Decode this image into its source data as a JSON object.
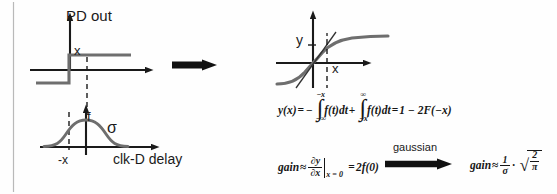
{
  "figure": {
    "width": 557,
    "height": 194,
    "background": "#fefefe",
    "curve_color": "#6e6e6e",
    "axis_color": "#1a1a1a",
    "border_color": "#b9b9b9"
  },
  "left_panel": {
    "step_plot": {
      "y_axis_label": "PD out",
      "x_marker_label": "x"
    },
    "gaussian_plot": {
      "amplitude_label": "f",
      "sigma_label": "σ",
      "neg_x_label": "-x",
      "x_axis_label": "clk-D delay"
    }
  },
  "transition_arrow": {
    "name": "right-arrow"
  },
  "right_panel": {
    "sigmoid_plot": {
      "y_axis_label": "y",
      "x_marker_label": "x"
    },
    "integral_equation": {
      "lhs": "y(x)",
      "equals": "=",
      "minus": "−",
      "integral_1": {
        "upper_limit": "−x",
        "lower_limit": "−∞",
        "integrand": "f(t)dt"
      },
      "plus": "+",
      "integral_2": {
        "upper_limit": "∞",
        "lower_limit": "−x",
        "integrand": "f(t)dt"
      },
      "equals2": "=",
      "result": "1 − 2F(−x)"
    },
    "gain_equation_left": {
      "label": "gain",
      "approx": "≈",
      "numerator": "∂y",
      "denominator": "∂x",
      "evaluated_at": "x = 0",
      "equals": "=",
      "result": "2f(0)"
    },
    "gaussian_arrow_label": "gaussian",
    "gain_equation_right": {
      "label": "gain",
      "approx": "≈",
      "frac_numerator": "1",
      "frac_denominator": "σ",
      "dot": "·",
      "sqrt_numerator": "2",
      "sqrt_denominator": "π"
    }
  }
}
